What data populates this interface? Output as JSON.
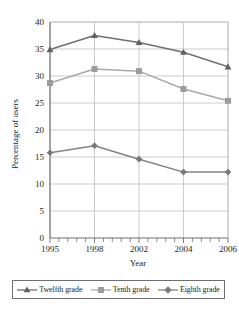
{
  "chart_data": {
    "type": "line",
    "title": "",
    "xlabel": "Year",
    "ylabel": "Percentage of users",
    "categories": [
      "1995",
      "1998",
      "2002",
      "2004",
      "2006"
    ],
    "x_tick_labels": [
      "1995",
      "1998",
      "2002",
      "2004",
      "2006"
    ],
    "y_tick_labels": [
      "0",
      "5",
      "10",
      "15",
      "20",
      "25",
      "30",
      "35",
      "40"
    ],
    "ylim": [
      0,
      40
    ],
    "y_tick_step": 5,
    "grid": "horizontal-and-vertical",
    "legend_position": "bottom",
    "minor_x_ticks_per_interval": 4,
    "series": [
      {
        "name": "Twelfth grade",
        "marker": "triangle",
        "color": "#6e7073",
        "values": [
          34.9,
          37.5,
          36.2,
          34.4,
          31.7
        ]
      },
      {
        "name": "Tenth grade",
        "marker": "square",
        "color": "#a7a9ac",
        "values": [
          28.7,
          31.3,
          30.9,
          27.6,
          25.4
        ]
      },
      {
        "name": "Eighth grade",
        "marker": "diamond",
        "color": "#808285",
        "values": [
          15.8,
          17.1,
          14.6,
          12.2,
          12.2
        ]
      }
    ]
  },
  "axes": {
    "x_label": "Year",
    "y_label": "Percentage of users"
  },
  "legend": {
    "items": [
      {
        "label": "Twelfth grade",
        "marker": "triangle",
        "color": "#6e7073"
      },
      {
        "label": "Tenth grade",
        "marker": "square",
        "color": "#a7a9ac"
      },
      {
        "label": "Eighth grade",
        "marker": "diamond",
        "color": "#808285"
      }
    ]
  },
  "colors": {
    "twelfth_grade": "#6e7073",
    "tenth_grade": "#a7a9ac",
    "eighth_grade": "#808285",
    "grid": "#bcbec0",
    "axis": "#6d6e71",
    "text": "#231f20"
  }
}
